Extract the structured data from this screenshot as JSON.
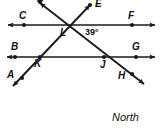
{
  "figure": {
    "caption": "North",
    "stroke_color": "#1a1a1a",
    "point_color": "#1a1a1a",
    "background_color": "#ffffff",
    "width": 163,
    "height": 131
  },
  "angle": {
    "value": "39",
    "unit": "°",
    "text": "39°",
    "vertex": "L",
    "x": 86,
    "y": 31
  },
  "points": [
    {
      "id": "A",
      "label": "A",
      "label_x": 7,
      "label_y": 71,
      "dot_x": 22,
      "dot_y": 78
    },
    {
      "id": "B",
      "label": "B",
      "label_x": 11,
      "label_y": 43,
      "dot_x": 15,
      "dot_y": 57
    },
    {
      "id": "C",
      "label": "C",
      "label_x": 19,
      "label_y": 12,
      "dot_x": 24,
      "dot_y": 25
    },
    {
      "id": "D",
      "label": "D",
      "label_x": 37,
      "label_y": -4,
      "dot_x": 40,
      "dot_y": 2
    },
    {
      "id": "E",
      "label": "E",
      "label_x": 95,
      "label_y": 0,
      "dot_x": 91,
      "dot_y": 4
    },
    {
      "id": "F",
      "label": "F",
      "label_x": 128,
      "label_y": 12,
      "dot_x": 132,
      "dot_y": 25
    },
    {
      "id": "G",
      "label": "G",
      "label_x": 133,
      "label_y": 43,
      "dot_x": 136,
      "dot_y": 57
    },
    {
      "id": "H",
      "label": "H",
      "label_x": 119,
      "label_y": 73,
      "dot_x": 133,
      "dot_y": 75
    },
    {
      "id": "J",
      "label": "J",
      "label_x": 101,
      "label_y": 61,
      "dot_x": 104,
      "dot_y": 57
    },
    {
      "id": "K",
      "label": "K",
      "label_x": 35,
      "label_y": 60,
      "dot_x": 40,
      "dot_y": 57
    },
    {
      "id": "L",
      "label": "L",
      "label_x": 61,
      "label_y": 29,
      "dot_x": 66,
      "dot_y": 25
    }
  ],
  "lines": [
    {
      "id": "line-CF",
      "name": "horizontal-line-CF",
      "endpoints": "C to F",
      "x1": 4,
      "y1": 25,
      "x2": 159,
      "y2": 25,
      "arrow_start": true,
      "arrow_end": true
    },
    {
      "id": "line-BG",
      "name": "horizontal-line-BG",
      "endpoints": "B to G",
      "x1": 3,
      "y1": 57,
      "x2": 159,
      "y2": 57,
      "arrow_start": true,
      "arrow_end": true
    },
    {
      "id": "line-AE",
      "name": "transversal-line-AE",
      "endpoints": "A to E",
      "x1": 9,
      "y1": 91,
      "x2": 92,
      "y2": 3,
      "arrow_start": true,
      "arrow_end": true
    },
    {
      "id": "line-DH",
      "name": "transversal-line-DH",
      "endpoints": "D to H",
      "x1": 39,
      "y1": 1,
      "x2": 147,
      "y2": 87,
      "arrow_start": true,
      "arrow_end": true
    }
  ]
}
